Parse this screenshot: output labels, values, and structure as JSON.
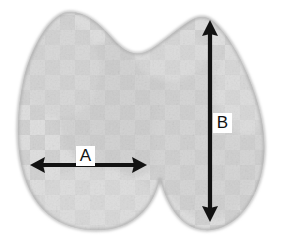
{
  "figure": {
    "name": "grayscale-scan-with-measurement-annotations",
    "width": 284,
    "height": 243,
    "background_color": "#ffffff",
    "modality_appearance": "grayscale ultrasound-like scan of a bilobed gland on white background"
  },
  "specimen": {
    "name": "bilobed-gland-silhouette",
    "fill_color": "#d6d6d6",
    "outline_color": "#b0b0b0",
    "texture": "faint checkerboard",
    "texture_square_px": 15,
    "texture_light_color": "#dedede",
    "texture_dark_color": "#cfcfcf",
    "bounds": {
      "left": 18,
      "top": 10,
      "right": 266,
      "bottom": 232
    },
    "lobes": [
      {
        "name": "left-lobe",
        "peak_x": 70,
        "peak_y": 12,
        "bottom_y": 229
      },
      {
        "name": "right-lobe",
        "peak_x": 207,
        "peak_y": 18,
        "bottom_y": 228
      }
    ],
    "isthmus_notch": {
      "name": "inferior-notch",
      "x": 165,
      "top_y": 178
    }
  },
  "annotations": {
    "color": "#121212",
    "stroke_width": 4,
    "items": [
      {
        "id": "measurement-a",
        "label": "A",
        "orientation": "horizontal",
        "style": "double-headed-arrow",
        "x1": 30,
        "y1": 165,
        "x2": 147,
        "y2": 165,
        "label_x": 76,
        "label_y": 146
      },
      {
        "id": "measurement-b",
        "label": "B",
        "orientation": "vertical",
        "style": "double-headed-arrow",
        "x1": 210,
        "y1": 20,
        "x2": 210,
        "y2": 222,
        "label_x": 213,
        "label_y": 113
      }
    ]
  }
}
